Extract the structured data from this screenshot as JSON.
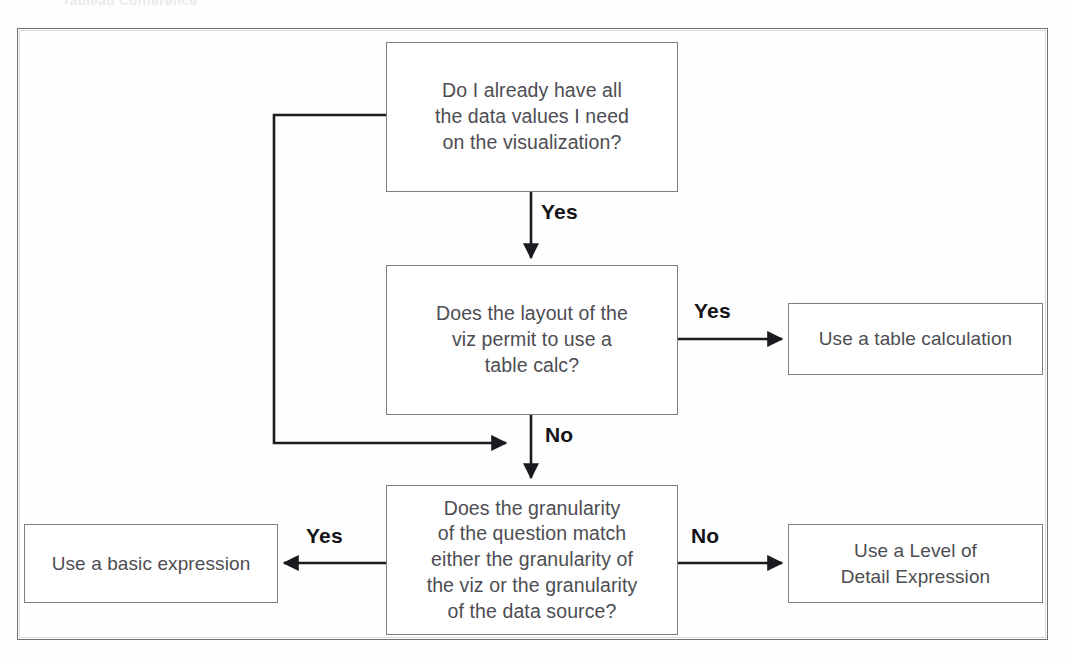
{
  "header": {
    "cropped_text": "Tableau Conference"
  },
  "diagram": {
    "colors": {
      "node_border": "#7d7d83",
      "node_text": "#4d4d52",
      "frame_border": "#6f6f74",
      "connector": "#1b1b1f",
      "label_text": "#141417",
      "background": "#fefefe"
    },
    "nodes": [
      {
        "id": "q1",
        "type": "decision",
        "text": "Do I already have all\nthe data values I need\non the visualization?"
      },
      {
        "id": "q2",
        "type": "decision",
        "text": "Does the layout of the\nviz permit to use a\ntable calc?"
      },
      {
        "id": "q3",
        "type": "decision",
        "text": "Does the granularity\nof the question match\neither the granularity of\nthe viz or the granularity\nof the data source?"
      },
      {
        "id": "table_calc",
        "type": "outcome",
        "text": "Use a table calculation"
      },
      {
        "id": "lod",
        "type": "outcome",
        "text": "Use a Level of\nDetail Expression"
      },
      {
        "id": "basic",
        "type": "outcome",
        "text": "Use a basic expression"
      }
    ],
    "edges": [
      {
        "id": "e_q1_q2",
        "from": "q1",
        "to": "q2",
        "label": "Yes"
      },
      {
        "id": "e_q2_tablecalc",
        "from": "q2",
        "to": "table_calc",
        "label": "Yes"
      },
      {
        "id": "e_q2_q3",
        "from": "q2",
        "to": "q3",
        "label": "No"
      },
      {
        "id": "e_q1_loop",
        "from": "q1",
        "to": "q3",
        "label": ""
      },
      {
        "id": "e_q3_basic",
        "from": "q3",
        "to": "basic",
        "label": "Yes"
      },
      {
        "id": "e_q3_lod",
        "from": "q3",
        "to": "lod",
        "label": "No"
      }
    ]
  }
}
